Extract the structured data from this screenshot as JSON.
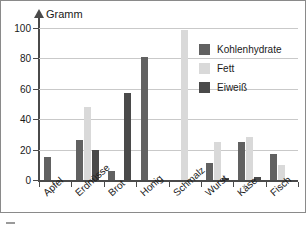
{
  "chart_data": {
    "type": "bar",
    "title": "",
    "xlabel": "",
    "ylabel": "Gramm",
    "ylim": [
      0,
      100
    ],
    "yticks": [
      0,
      20,
      40,
      60,
      80,
      100
    ],
    "grid": true,
    "legend_position": "top-right",
    "categories": [
      "Apfel",
      "Erdnüsse",
      "Brot",
      "Honig",
      "Schmalz",
      "Wurst",
      "Käse",
      "Fisch"
    ],
    "series": [
      {
        "name": "Kohlenhydrate",
        "color": "#616161",
        "values": [
          15,
          26,
          6,
          81,
          0,
          11,
          25,
          17
        ]
      },
      {
        "name": "Fett",
        "color": "#d9d9d9",
        "values": [
          0,
          48,
          0,
          0,
          99,
          25,
          28,
          10
        ]
      },
      {
        "name": "Eiweiß",
        "color": "#4a4a4a",
        "values": [
          0,
          20,
          57,
          0,
          0,
          1,
          2,
          0
        ]
      }
    ]
  },
  "axis": {
    "y_title": "Gramm",
    "tick_labels": [
      "100",
      "80",
      "60",
      "40",
      "20",
      "0"
    ]
  },
  "legend": {
    "items": [
      {
        "label": "Kohlenhydrate",
        "color": "#616161"
      },
      {
        "label": "Fett",
        "color": "#d9d9d9"
      },
      {
        "label": "Eiweiß",
        "color": "#4a4a4a"
      }
    ]
  },
  "colors": {
    "kohlenhydrate": "#616161",
    "fett": "#d9d9d9",
    "eiweiss": "#4a4a4a",
    "axis": "#4a4a4a",
    "grid": "#c9c9c9",
    "frame": "#8a8a8a",
    "background": "#ffffff"
  }
}
